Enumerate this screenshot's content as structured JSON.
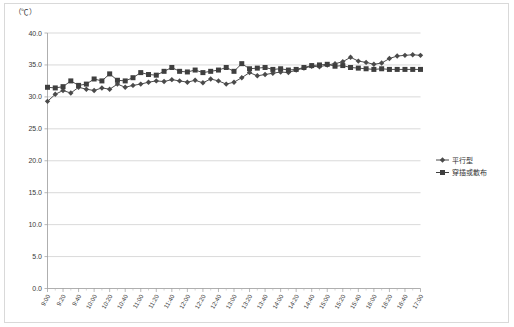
{
  "unit_label": "（℃）",
  "chart_data": {
    "type": "line",
    "title": "",
    "xlabel": "",
    "ylabel": "（℃）",
    "ylim": [
      0.0,
      40.0
    ],
    "ytick_step": 5.0,
    "ytick_labels": [
      "0.0",
      "5.0",
      "10.0",
      "15.0",
      "20.0",
      "25.0",
      "30.0",
      "35.0",
      "40.0"
    ],
    "grid": true,
    "legend_position": "right",
    "categories": [
      "9:00",
      "9:10",
      "9:20",
      "9:30",
      "9:40",
      "9:50",
      "10:00",
      "10:10",
      "10:20",
      "10:30",
      "10:40",
      "10:50",
      "11:00",
      "11:10",
      "11:20",
      "11:30",
      "11:40",
      "11:50",
      "12:00",
      "12:10",
      "12:20",
      "12:30",
      "12:40",
      "12:50",
      "13:00",
      "13:10",
      "13:20",
      "13:30",
      "13:40",
      "13:50",
      "14:00",
      "14:10",
      "14:20",
      "14:30",
      "14:40",
      "14:50",
      "15:00",
      "15:10",
      "15:20",
      "15:30",
      "15:40",
      "15:50",
      "16:00",
      "16:10",
      "16:20",
      "16:30",
      "16:40",
      "16:50",
      "17:00"
    ],
    "xtick_labels": [
      "9:00",
      "9:20",
      "9:40",
      "10:00",
      "10:20",
      "10:40",
      "11:00",
      "11:20",
      "11:40",
      "12:00",
      "12:20",
      "12:40",
      "13:00",
      "13:20",
      "13:40",
      "14:00",
      "14:20",
      "14:40",
      "15:00",
      "15:20",
      "15:40",
      "16:00",
      "16:20",
      "16:40",
      "17:00"
    ],
    "series": [
      {
        "name": "平行型",
        "marker": "diamond",
        "color": "#4a4a4a",
        "values": [
          29.3,
          30.4,
          31.0,
          30.6,
          31.5,
          31.2,
          31.0,
          31.4,
          31.2,
          32.0,
          31.5,
          31.8,
          32.0,
          32.3,
          32.5,
          32.4,
          32.7,
          32.5,
          32.3,
          32.6,
          32.2,
          32.8,
          32.5,
          32.0,
          32.3,
          33.0,
          33.8,
          33.3,
          33.5,
          33.7,
          33.9,
          33.8,
          34.2,
          34.5,
          34.8,
          34.7,
          35.0,
          35.2,
          35.5,
          36.2,
          35.6,
          35.4,
          35.1,
          35.3,
          36.0,
          36.4,
          36.5,
          36.6,
          36.5
        ]
      },
      {
        "name": "穿插或散布",
        "marker": "square",
        "color": "#3f3f3f",
        "values": [
          31.5,
          31.4,
          31.6,
          32.5,
          31.8,
          32.0,
          32.8,
          32.5,
          33.6,
          32.6,
          32.5,
          33.0,
          33.8,
          33.5,
          33.4,
          34.0,
          34.6,
          34.0,
          33.9,
          34.2,
          33.8,
          34.0,
          34.2,
          34.6,
          34.0,
          35.2,
          34.4,
          34.5,
          34.6,
          34.3,
          34.4,
          34.2,
          34.3,
          34.6,
          34.9,
          35.0,
          35.1,
          34.8,
          34.9,
          34.6,
          34.5,
          34.4,
          34.3,
          34.4,
          34.3,
          34.3,
          34.3,
          34.3,
          34.3
        ]
      }
    ]
  },
  "legend": {
    "items": [
      {
        "label": "平行型"
      },
      {
        "label": "穿插或散布"
      }
    ]
  }
}
